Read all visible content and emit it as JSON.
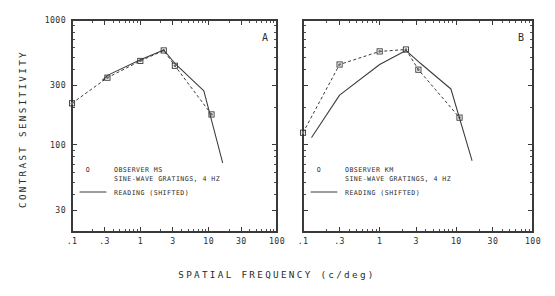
{
  "figure": {
    "xlabel": "SPATIAL FREQUENCY (c/deg)",
    "ylabel": "CONTRAST SENSITIVITY"
  },
  "chart_data": [
    {
      "type": "line",
      "panel": "A",
      "title": "",
      "xlabel": "SPATIAL FREQUENCY (c/deg)",
      "ylabel": "CONTRAST SENSITIVITY",
      "xscale": "log",
      "yscale": "log",
      "xlim": [
        0.1,
        100
      ],
      "ylim": [
        20,
        1000
      ],
      "xticks": [
        0.1,
        0.3,
        1,
        3,
        10,
        30,
        100
      ],
      "xticklabels": [
        ".1",
        ".3",
        "1",
        "3",
        "10",
        "30",
        "100"
      ],
      "yticks": [
        30,
        100,
        300,
        1000
      ],
      "yticklabels": [
        "30",
        "100",
        "300",
        "1000"
      ],
      "grid": false,
      "legend_position": "lower-left-inside",
      "series": [
        {
          "name": "OBSERVER MS  SINE-WAVE GRATINGS, 4 HZ",
          "style": "dashed-with-open-square-markers",
          "marker": "square",
          "x": [
            0.1,
            0.33,
            1.0,
            2.2,
            3.2,
            11.0
          ],
          "y": [
            215,
            345,
            470,
            570,
            430,
            175
          ]
        },
        {
          "name": "READING (SHIFTED)",
          "style": "solid",
          "marker": "none",
          "x": [
            0.28,
            0.33,
            1.0,
            2.2,
            3.2,
            8.5,
            16.0
          ],
          "y": [
            330,
            360,
            480,
            575,
            450,
            270,
            72
          ]
        }
      ],
      "legend": [
        {
          "symbol": "open-square",
          "lines": [
            "OBSERVER MS",
            "SINE-WAVE GRATINGS, 4 HZ"
          ]
        },
        {
          "symbol": "solid-line",
          "lines": [
            "READING (SHIFTED)"
          ]
        }
      ]
    },
    {
      "type": "line",
      "panel": "B",
      "title": "",
      "xlabel": "SPATIAL FREQUENCY (c/deg)",
      "ylabel": "CONTRAST SENSITIVITY",
      "xscale": "log",
      "yscale": "log",
      "xlim": [
        0.1,
        100
      ],
      "ylim": [
        20,
        1000
      ],
      "xticks": [
        0.1,
        0.3,
        1,
        3,
        10,
        30,
        100
      ],
      "xticklabels": [
        ".1",
        ".3",
        "1",
        "3",
        "10",
        "30",
        "100"
      ],
      "yticks": [
        30,
        100,
        300,
        1000
      ],
      "yticklabels": [
        "30",
        "100",
        "300",
        "1000"
      ],
      "grid": false,
      "legend_position": "lower-left-inside",
      "series": [
        {
          "name": "OBSERVER KM  SINE-WAVE GRATINGS, 4 HZ",
          "style": "dashed-with-open-square-markers",
          "marker": "square",
          "x": [
            0.1,
            0.3,
            1.0,
            2.2,
            3.2,
            11.0
          ],
          "y": [
            125,
            440,
            560,
            580,
            400,
            165
          ]
        },
        {
          "name": "READING (SHIFTED)",
          "style": "solid",
          "marker": "none",
          "x": [
            0.13,
            0.3,
            1.0,
            2.2,
            3.4,
            8.5,
            16.0
          ],
          "y": [
            115,
            250,
            440,
            570,
            450,
            280,
            75
          ]
        }
      ],
      "legend": [
        {
          "symbol": "open-square",
          "lines": [
            "OBSERVER KM",
            "SINE-WAVE GRATINGS, 4 HZ"
          ]
        },
        {
          "symbol": "solid-line",
          "lines": [
            "READING (SHIFTED)"
          ]
        }
      ]
    }
  ],
  "panels": [
    {
      "letter": "A",
      "legend_symbol": "O",
      "legend_line1": "OBSERVER MS",
      "legend_line2": "SINE-WAVE GRATINGS, 4 HZ",
      "legend_line3": "READING (SHIFTED)"
    },
    {
      "letter": "B",
      "legend_symbol": "O",
      "legend_line1": "OBSERVER KM",
      "legend_line2": "SINE-WAVE GRATINGS, 4 HZ",
      "legend_line3": "READING (SHIFTED)"
    }
  ]
}
